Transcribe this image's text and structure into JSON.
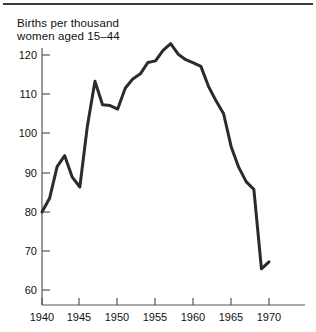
{
  "figure": {
    "title_line1": "Births per thousand",
    "title_line2": "women aged 15–44",
    "title_text": "Births per thousand\nwomen aged 15–44",
    "rule_color": "#3a3a3a",
    "line_color": "#2b2b2b",
    "axis_color": "#555555",
    "background": "#ffffff"
  },
  "chart_data": {
    "type": "line",
    "title": "Births per thousand women aged 15–44",
    "xlabel": "",
    "ylabel": "Births per thousand women aged 15–44",
    "xlim": [
      1940,
      1972
    ],
    "ylim": [
      57,
      124
    ],
    "grid": false,
    "legend": false,
    "x_ticks": [
      1940,
      1945,
      1950,
      1955,
      1960,
      1965,
      1970
    ],
    "x_tick_labels": [
      "1940",
      "1945",
      "1950",
      "1955",
      "1960",
      "1965",
      "1970"
    ],
    "y_ticks": [
      60,
      70,
      80,
      90,
      100,
      110,
      120
    ],
    "y_tick_labels": [
      "60",
      "70",
      "80",
      "90",
      "100",
      "110",
      "120"
    ],
    "series": [
      {
        "name": "Births per thousand women aged 15-44",
        "x": [
          1940,
          1941,
          1942,
          1943,
          1944,
          1945,
          1946,
          1947,
          1948,
          1949,
          1950,
          1951,
          1952,
          1953,
          1954,
          1955,
          1956,
          1957,
          1958,
          1959,
          1960,
          1961,
          1962,
          1963,
          1964,
          1965,
          1966,
          1967,
          1968,
          1969,
          1970
        ],
        "values": [
          79.9,
          83.4,
          91.5,
          94.3,
          88.8,
          86.3,
          101.9,
          113.3,
          107.3,
          107.1,
          106.2,
          111.5,
          113.9,
          115.2,
          118.1,
          118.5,
          121.2,
          122.9,
          120.2,
          118.8,
          118.0,
          117.1,
          112.0,
          108.3,
          105.0,
          96.6,
          91.3,
          87.6,
          85.7,
          65.4,
          67.2
        ],
        "color": "#2b2b2b",
        "line_width": 3
      }
    ]
  }
}
